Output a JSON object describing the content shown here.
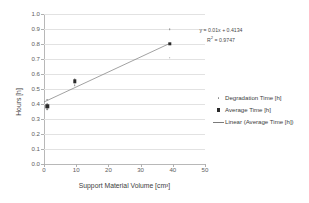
{
  "chart_data": {
    "type": "scatter",
    "title": "",
    "xlabel": "Support Material Volume [cm³]",
    "ylabel": "Hours [h]",
    "xlim": [
      0,
      50
    ],
    "ylim": [
      0.0,
      1.0
    ],
    "xticks": [
      0,
      10,
      20,
      30,
      40,
      50
    ],
    "xtick_labels": [
      "0",
      "10",
      "20",
      "30",
      "40",
      "50"
    ],
    "yticks": [
      0.0,
      0.1,
      0.2,
      0.3,
      0.4,
      0.5,
      0.6,
      0.7,
      0.8,
      0.9,
      1.0
    ],
    "ytick_labels": [
      "0.0",
      "0.1",
      "0.2",
      "0.3",
      "0.4",
      "0.5",
      "0.6",
      "0.7",
      "0.8",
      "0.9",
      "1.0"
    ],
    "grid": "horizontal",
    "legend_position": "right",
    "series": [
      {
        "name": "Degradation Time [h]",
        "marker": "dot",
        "color": "#8a8a8a",
        "points": [
          {
            "x": 1.0,
            "y": 0.43
          },
          {
            "x": 1.0,
            "y": 0.4
          },
          {
            "x": 1.0,
            "y": 0.385
          },
          {
            "x": 1.0,
            "y": 0.365
          },
          {
            "x": 9.5,
            "y": 0.565
          },
          {
            "x": 9.5,
            "y": 0.545
          },
          {
            "x": 9.5,
            "y": 0.525
          },
          {
            "x": 39.0,
            "y": 0.9
          },
          {
            "x": 39.0,
            "y": 0.71
          }
        ]
      },
      {
        "name": "Average Time [h]",
        "marker": "square",
        "color": "#2b2b2b",
        "points": [
          {
            "x": 1.0,
            "y": 0.385
          },
          {
            "x": 9.5,
            "y": 0.552
          },
          {
            "x": 39.0,
            "y": 0.8
          }
        ]
      },
      {
        "name": "Linear (Average Time [h])",
        "marker": "line",
        "color": "#7a7a7a",
        "fit": {
          "slope": 0.01,
          "intercept": 0.4134,
          "x_start": 0.0,
          "x_end": 39.0
        }
      }
    ],
    "annotations": {
      "equation": "y = 0.01x + 0.4134",
      "r_squared_prefix": "R",
      "r_squared_exponent": "2",
      "r_squared_value": " = 0.9747"
    }
  },
  "legend": {
    "items": [
      {
        "label": "Degradation Time [h]",
        "key": "dot"
      },
      {
        "label": "Average Time [h]",
        "key": "square"
      },
      {
        "label": "Linear (Average Time [h])",
        "key": "line"
      }
    ]
  }
}
